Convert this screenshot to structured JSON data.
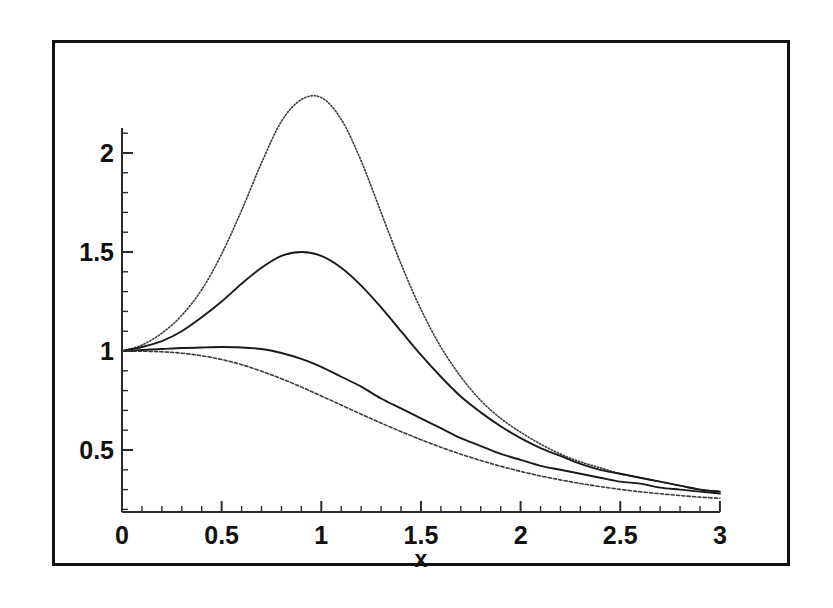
{
  "figure": {
    "background_color": "#ffffff",
    "frame_color": "#111111",
    "axis_color": "#2a2a2a",
    "x_axis_title": "x"
  },
  "axes": {
    "x_tick_labels": [
      "0",
      "0.5",
      "1",
      "1.5",
      "2",
      "2.5",
      "3"
    ],
    "y_tick_labels": [
      "0.5",
      "1",
      "1.5",
      "2"
    ]
  },
  "chart_data": {
    "type": "line",
    "title": "",
    "xlabel": "x",
    "ylabel": "",
    "xlim": [
      0,
      3
    ],
    "ylim": [
      0.19,
      2.4
    ],
    "grid": false,
    "legend": "none",
    "x_ticks_major": [
      0,
      0.5,
      1,
      1.5,
      2,
      2.5,
      3
    ],
    "x_ticks_minor_per_interval": 5,
    "y_ticks_major": [
      0.5,
      1,
      1.5,
      2
    ],
    "y_ticks_minor_per_interval": 5,
    "x": [
      0,
      0.1,
      0.2,
      0.3,
      0.4,
      0.5,
      0.6,
      0.7,
      0.8,
      0.9,
      1.0,
      1.1,
      1.2,
      1.3,
      1.4,
      1.5,
      1.6,
      1.7,
      1.8,
      1.9,
      2.0,
      2.1,
      2.2,
      2.3,
      2.4,
      2.5,
      2.6,
      2.7,
      2.8,
      2.9,
      3.0
    ],
    "series": [
      {
        "name": "curve-1-tall-peak",
        "style": "dotted",
        "color": "#3a3a3a",
        "peak_x": 0.97,
        "peak_y": 2.28,
        "values": [
          1.0,
          1.03,
          1.09,
          1.18,
          1.31,
          1.49,
          1.71,
          1.95,
          2.16,
          2.27,
          2.28,
          2.17,
          1.96,
          1.7,
          1.44,
          1.21,
          1.02,
          0.87,
          0.75,
          0.66,
          0.59,
          0.53,
          0.48,
          0.44,
          0.41,
          0.38,
          0.36,
          0.34,
          0.32,
          0.3,
          0.29
        ]
      },
      {
        "name": "curve-2-mid-peak",
        "style": "solid",
        "color": "#1a1a1a",
        "peak_x": 0.9,
        "peak_y": 1.5,
        "values": [
          1.0,
          1.02,
          1.05,
          1.1,
          1.17,
          1.25,
          1.34,
          1.42,
          1.48,
          1.5,
          1.48,
          1.42,
          1.33,
          1.22,
          1.1,
          0.98,
          0.87,
          0.77,
          0.69,
          0.62,
          0.56,
          0.51,
          0.47,
          0.43,
          0.4,
          0.38,
          0.36,
          0.34,
          0.32,
          0.3,
          0.29
        ]
      },
      {
        "name": "curve-3-flat-bump",
        "style": "solid",
        "color": "#1a1a1a",
        "peak_x": 0.55,
        "peak_y": 1.02,
        "values": [
          1.0,
          1.005,
          1.01,
          1.015,
          1.018,
          1.02,
          1.018,
          1.01,
          0.99,
          0.96,
          0.92,
          0.87,
          0.82,
          0.76,
          0.71,
          0.66,
          0.61,
          0.56,
          0.52,
          0.48,
          0.45,
          0.42,
          0.4,
          0.38,
          0.36,
          0.34,
          0.33,
          0.31,
          0.3,
          0.29,
          0.28
        ]
      },
      {
        "name": "curve-4-monotonic-decay",
        "style": "dashed",
        "color": "#3a3a3a",
        "peak_x": 0.0,
        "peak_y": 1.0,
        "values": [
          1.0,
          0.999,
          0.996,
          0.989,
          0.976,
          0.957,
          0.931,
          0.898,
          0.86,
          0.818,
          0.773,
          0.727,
          0.681,
          0.636,
          0.593,
          0.552,
          0.514,
          0.479,
          0.447,
          0.418,
          0.392,
          0.369,
          0.349,
          0.331,
          0.315,
          0.301,
          0.289,
          0.279,
          0.27,
          0.262,
          0.256
        ]
      }
    ]
  }
}
